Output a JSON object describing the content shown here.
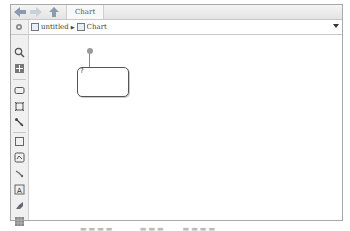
{
  "toolbar": {
    "back_icon": "back-arrow-icon",
    "forward_icon": "forward-arrow-icon",
    "up_icon": "up-arrow-icon",
    "tab_label": "Chart"
  },
  "address_bar": {
    "crumbs": [
      {
        "label": "untitled",
        "icon": "model-icon"
      },
      {
        "label": "Chart",
        "icon": "chart-icon"
      }
    ],
    "separator": "▶"
  },
  "palette": {
    "tools": [
      "zoom-icon",
      "fit-view-icon",
      "state-icon",
      "box-icon",
      "default-transition-icon",
      "history-junction-icon",
      "graphical-function-icon",
      "matlab-function-icon",
      "truth-table-icon",
      "annotation-icon",
      "image-icon",
      "table-icon"
    ]
  },
  "canvas": {
    "state": {
      "label": "?"
    }
  },
  "colors": {
    "border": "#a8a8a8",
    "state_border": "#555555",
    "junction": "#9a9a9a"
  }
}
